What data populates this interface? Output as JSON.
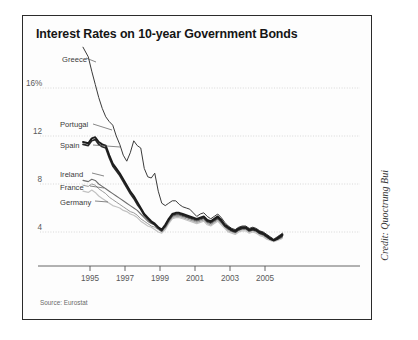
{
  "chart": {
    "title": "Interest Rates on 10-year Government Bonds",
    "source": "Source: Eurostat",
    "credit": "Credit: Quoctrung Bui"
  },
  "axes": {
    "y_ticks": [
      "16%",
      "12",
      "8",
      "4"
    ],
    "x_ticks": [
      "1995",
      "1997",
      "1999",
      "2001",
      "2003",
      "2005"
    ]
  },
  "series_labels": {
    "greece": "Greece",
    "portugal": "Portugal",
    "spain": "Spain",
    "ireland": "Ireland",
    "france": "France",
    "germany": "Germany"
  },
  "colors": {
    "greece": "#3a3a3a",
    "portugal": "#1c1c1c",
    "spain": "#2a2a2a",
    "ireland": "#6e6e6e",
    "france": "#9a9a9a",
    "germany": "#c2c2c2",
    "frame": "#2b2b2b",
    "grid": "#cfcfcf",
    "axis": "#555555",
    "background": "#fdfdfd"
  },
  "chart_data": {
    "type": "line",
    "title": "Interest Rates on 10-year Government Bonds",
    "xlabel": "",
    "ylabel": "",
    "ylim": [
      2,
      21
    ],
    "xlim": [
      1994.5,
      2006.2
    ],
    "yticks": [
      4,
      8,
      12,
      16
    ],
    "ytick_labels": [
      "4",
      "8",
      "12",
      "16%"
    ],
    "xticks": [
      1995,
      1997,
      1999,
      2001,
      2003,
      2005
    ],
    "grid": "horizontal-dotted",
    "legend": "inline-labels-left",
    "annotation": "Source: Eurostat",
    "x": [
      1994.6,
      1994.9,
      1995.1,
      1995.3,
      1995.5,
      1995.7,
      1995.9,
      1996.1,
      1996.3,
      1996.5,
      1996.7,
      1996.9,
      1997.1,
      1997.3,
      1997.5,
      1997.7,
      1997.9,
      1998.1,
      1998.3,
      1998.5,
      1998.7,
      1998.9,
      1999.1,
      1999.3,
      1999.5,
      1999.7,
      1999.9,
      2000.1,
      2000.3,
      2000.5,
      2000.7,
      2000.9,
      2001.1,
      2001.3,
      2001.5,
      2001.7,
      2001.9,
      2002.1,
      2002.3,
      2002.5,
      2002.7,
      2002.9,
      2003.1,
      2003.3,
      2003.5,
      2003.7,
      2003.9,
      2004.1,
      2004.3,
      2004.5,
      2004.7,
      2004.9,
      2005.1,
      2005.3,
      2005.5,
      2005.7,
      2005.9,
      2006.0
    ],
    "series": [
      {
        "name": "Greece",
        "values": [
          19.4,
          18.6,
          17.4,
          16.3,
          15.2,
          14.3,
          13.6,
          13.2,
          12.9,
          12.0,
          11.3,
          10.4,
          9.9,
          10.6,
          11.6,
          11.2,
          11.0,
          9.3,
          8.6,
          8.5,
          8.9,
          7.4,
          6.4,
          6.2,
          6.4,
          6.6,
          6.6,
          6.3,
          6.1,
          6.0,
          5.9,
          5.6,
          5.3,
          5.5,
          5.6,
          5.3,
          5.1,
          5.3,
          5.5,
          5.2,
          4.8,
          4.5,
          4.3,
          4.2,
          4.4,
          4.5,
          4.5,
          4.3,
          4.4,
          4.3,
          4.1,
          4.0,
          3.8,
          3.6,
          3.4,
          3.6,
          3.8,
          3.9
        ]
      },
      {
        "name": "Portugal",
        "values": [
          11.5,
          11.4,
          11.8,
          11.9,
          11.5,
          11.3,
          11.2,
          10.4,
          9.7,
          9.3,
          8.9,
          8.4,
          7.9,
          7.4,
          7.0,
          6.5,
          6.0,
          5.5,
          5.2,
          4.9,
          4.7,
          4.4,
          4.2,
          4.6,
          5.1,
          5.5,
          5.6,
          5.6,
          5.5,
          5.4,
          5.3,
          5.2,
          5.1,
          5.2,
          5.3,
          5.0,
          4.9,
          5.1,
          5.3,
          5.0,
          4.6,
          4.4,
          4.2,
          4.1,
          4.3,
          4.4,
          4.4,
          4.2,
          4.3,
          4.2,
          4.0,
          3.9,
          3.7,
          3.5,
          3.3,
          3.5,
          3.7,
          3.8
        ]
      },
      {
        "name": "Spain",
        "values": [
          11.3,
          11.2,
          11.6,
          11.7,
          11.3,
          11.1,
          11.0,
          10.2,
          9.5,
          9.1,
          8.7,
          8.2,
          7.7,
          7.2,
          6.8,
          6.3,
          5.9,
          5.4,
          5.1,
          4.8,
          4.6,
          4.3,
          4.1,
          4.5,
          5.0,
          5.4,
          5.5,
          5.5,
          5.4,
          5.3,
          5.2,
          5.1,
          5.0,
          5.1,
          5.2,
          4.9,
          4.8,
          5.0,
          5.2,
          4.9,
          4.5,
          4.3,
          4.1,
          4.0,
          4.2,
          4.3,
          4.3,
          4.1,
          4.2,
          4.1,
          3.9,
          3.8,
          3.6,
          3.4,
          3.3,
          3.4,
          3.6,
          3.7
        ]
      },
      {
        "name": "Ireland",
        "values": [
          8.3,
          8.2,
          8.4,
          8.3,
          8.0,
          7.8,
          7.6,
          7.4,
          7.2,
          7.0,
          6.8,
          6.6,
          6.4,
          6.2,
          6.0,
          5.8,
          5.5,
          5.2,
          4.9,
          4.7,
          4.6,
          4.4,
          4.2,
          4.4,
          4.9,
          5.3,
          5.4,
          5.4,
          5.3,
          5.2,
          5.1,
          5.0,
          4.9,
          5.0,
          5.1,
          4.8,
          4.7,
          4.9,
          5.1,
          4.8,
          4.5,
          4.2,
          4.1,
          4.0,
          4.2,
          4.3,
          4.3,
          4.1,
          4.2,
          4.1,
          3.9,
          3.8,
          3.6,
          3.4,
          3.3,
          3.4,
          3.5,
          3.6
        ]
      },
      {
        "name": "France",
        "values": [
          7.9,
          7.8,
          8.0,
          7.9,
          7.6,
          7.4,
          7.2,
          6.9,
          6.7,
          6.5,
          6.3,
          6.1,
          5.9,
          5.7,
          5.6,
          5.4,
          5.1,
          4.9,
          4.7,
          4.5,
          4.4,
          4.2,
          4.0,
          4.3,
          4.8,
          5.2,
          5.3,
          5.3,
          5.2,
          5.1,
          5.0,
          4.9,
          4.8,
          4.9,
          5.0,
          4.7,
          4.6,
          4.8,
          5.0,
          4.7,
          4.4,
          4.1,
          4.0,
          3.9,
          4.1,
          4.2,
          4.2,
          4.0,
          4.1,
          4.0,
          3.8,
          3.7,
          3.5,
          3.4,
          3.3,
          3.4,
          3.5,
          3.6
        ]
      },
      {
        "name": "Germany",
        "values": [
          7.4,
          7.3,
          7.5,
          7.3,
          7.0,
          6.8,
          6.6,
          6.4,
          6.2,
          6.1,
          6.0,
          5.8,
          5.7,
          5.5,
          5.4,
          5.2,
          4.9,
          4.7,
          4.5,
          4.4,
          4.2,
          4.0,
          3.9,
          4.2,
          4.7,
          5.1,
          5.2,
          5.2,
          5.1,
          5.0,
          4.9,
          4.8,
          4.7,
          4.8,
          4.9,
          4.6,
          4.5,
          4.7,
          4.9,
          4.6,
          4.3,
          4.0,
          3.9,
          3.8,
          4.0,
          4.1,
          4.1,
          3.9,
          4.0,
          3.9,
          3.7,
          3.6,
          3.4,
          3.3,
          3.2,
          3.3,
          3.4,
          3.5
        ]
      }
    ]
  }
}
